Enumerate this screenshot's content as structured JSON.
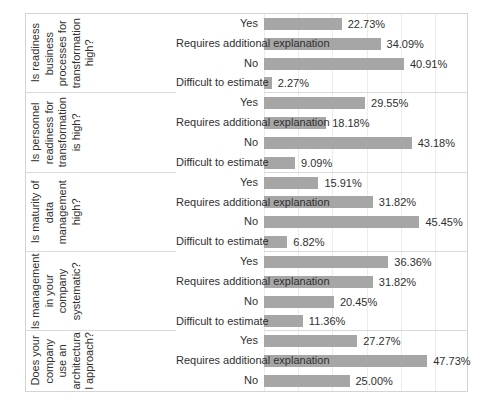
{
  "chart_data": {
    "type": "bar",
    "title": "",
    "xlabel": "",
    "ylabel": "",
    "orientation": "horizontal",
    "grid": true,
    "legend": "none",
    "xlim": [
      0,
      60
    ],
    "value_suffix": "%",
    "axis_gridline_values": [
      0,
      10,
      20,
      30,
      40,
      50
    ],
    "bar_color": "#a6a6a6",
    "groups": [
      {
        "label_lines": [
          "Is readiness",
          "business",
          "processes for",
          "transformation",
          "high?"
        ],
        "categories": [
          "Yes",
          "Requires additional explanation",
          "No",
          "Difficult to estimate"
        ],
        "values": [
          22.73,
          34.09,
          40.91,
          2.27
        ],
        "value_labels": [
          "22.73%",
          "34.09%",
          "40.91%",
          "2.27%"
        ]
      },
      {
        "label_lines": [
          "Is personnel",
          "readiness for",
          "transformation",
          "is high?"
        ],
        "categories": [
          "Yes",
          "Requires additional explanation",
          "No",
          "Difficult to estimate"
        ],
        "values": [
          29.55,
          18.18,
          43.18,
          9.09
        ],
        "value_labels": [
          "29.55%",
          "18.18%",
          "43.18%",
          "9.09%"
        ]
      },
      {
        "label_lines": [
          "Is maturity of",
          "data",
          "management",
          "high?"
        ],
        "categories": [
          "Yes",
          "Requires additional explanation",
          "No",
          "Difficult to estimate"
        ],
        "values": [
          15.91,
          31.82,
          45.45,
          6.82
        ],
        "value_labels": [
          "15.91%",
          "31.82%",
          "45.45%",
          "6.82%"
        ]
      },
      {
        "label_lines": [
          "Is management",
          "in your",
          "company",
          "systematic?"
        ],
        "categories": [
          "Yes",
          "Requires additional explanation",
          "No",
          "Difficult to estimate"
        ],
        "values": [
          36.36,
          31.82,
          20.45,
          11.36
        ],
        "value_labels": [
          "36.36%",
          "31.82%",
          "20.45%",
          "11.36%"
        ]
      },
      {
        "label_lines": [
          "Does your",
          "company",
          "use an",
          "architectura",
          "l approach?"
        ],
        "categories": [
          "Yes",
          "Requires additional explanation",
          "No"
        ],
        "values": [
          27.27,
          47.73,
          25.0
        ],
        "value_labels": [
          "27.27%",
          "47.73%",
          "25.00%"
        ]
      }
    ]
  }
}
